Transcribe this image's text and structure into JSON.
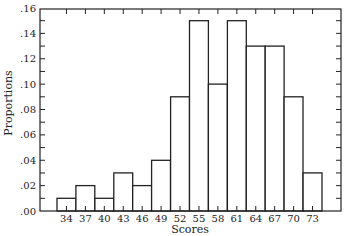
{
  "chart_data": {
    "type": "bar",
    "title": "",
    "xlabel": "Scores",
    "ylabel": "Proportions",
    "categories": [
      "34",
      "37",
      "40",
      "43",
      "46",
      "49",
      "52",
      "55",
      "58",
      "61",
      "64",
      "67",
      "70",
      "73"
    ],
    "values": [
      0.01,
      0.02,
      0.01,
      0.03,
      0.02,
      0.04,
      0.09,
      0.15,
      0.1,
      0.15,
      0.13,
      0.13,
      0.09,
      0.03
    ],
    "ylim": [
      0,
      0.16
    ],
    "yticks": [
      ".00",
      ".02",
      ".04",
      ".06",
      ".08",
      ".10",
      ".12",
      ".14",
      ".16"
    ],
    "ytick_values": [
      0,
      0.02,
      0.04,
      0.06,
      0.08,
      0.1,
      0.12,
      0.14,
      0.16
    ],
    "grid": false,
    "legend": null,
    "style": {
      "bar_fill": "#ffffff",
      "bar_stroke": "#222222",
      "axis_color": "#222222"
    }
  }
}
